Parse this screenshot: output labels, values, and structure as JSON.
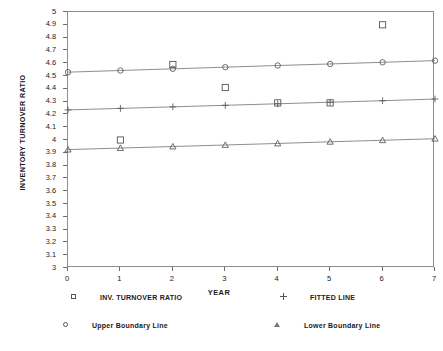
{
  "chart_data": {
    "type": "scatter",
    "title": "",
    "xlabel": "YEAR",
    "ylabel": "INVENTORY TURNOVER RATIO",
    "xlim": [
      0,
      7
    ],
    "ylim": [
      3,
      5
    ],
    "xticks": [
      0,
      1,
      2,
      3,
      4,
      5,
      6,
      7
    ],
    "yticks": [
      3,
      3.1,
      3.2,
      3.3,
      3.4,
      3.5,
      3.6,
      3.7,
      3.8,
      3.9,
      4,
      4.1,
      4.2,
      4.3,
      4.4,
      4.5,
      4.6,
      4.7,
      4.8,
      4.9,
      5
    ],
    "ytick_labels": [
      "3",
      "3.1",
      "3.2",
      "3.3",
      "3.4",
      "3.5",
      "3.6",
      "3.7",
      "3.8",
      "3.9",
      "4",
      "4.1",
      "4.2",
      "4.3",
      "4.4",
      "4.5",
      "4.6",
      "4.7",
      "4.8",
      "4.9",
      "5"
    ],
    "xtick_labels": [
      "0",
      "1",
      "2",
      "3",
      "4",
      "5",
      "6",
      "7"
    ],
    "grid": false,
    "legend_position": "below",
    "frame": true,
    "series": [
      {
        "name": "INV. TURNOVER RATIO",
        "marker": "square",
        "line": false,
        "x": [
          1,
          2,
          3,
          4,
          5,
          6
        ],
        "values": [
          4.0,
          4.59,
          4.41,
          4.29,
          4.29,
          4.9
        ]
      },
      {
        "name": "FITTED LINE",
        "marker": "plus",
        "line": true,
        "x": [
          0,
          1,
          2,
          3,
          4,
          5,
          6,
          7
        ],
        "values": [
          4.235,
          4.247,
          4.259,
          4.271,
          4.283,
          4.295,
          4.307,
          4.32
        ]
      },
      {
        "name": "Upper Boundary Line",
        "marker": "circle",
        "line": true,
        "x": [
          0,
          1,
          2,
          3,
          4,
          5,
          6,
          7
        ],
        "values": [
          4.53,
          4.543,
          4.556,
          4.569,
          4.582,
          4.594,
          4.607,
          4.62
        ]
      },
      {
        "name": "Lower Boundary Line",
        "marker": "triangle",
        "line": true,
        "x": [
          0,
          1,
          2,
          3,
          4,
          5,
          6,
          7
        ],
        "values": [
          3.925,
          3.937,
          3.949,
          3.961,
          3.973,
          3.986,
          3.998,
          4.01
        ]
      }
    ],
    "colors": {
      "line": "#7a7a7a",
      "marker_edge": "#555555",
      "axis": "#8d8d8d",
      "text": "#1a1a1a"
    }
  },
  "legend": {
    "items": [
      {
        "label": "INV. TURNOVER RATIO",
        "marker": "square"
      },
      {
        "label": "FITTED LINE",
        "marker": "plus"
      },
      {
        "label": "Upper Boundary Line",
        "marker": "circle"
      },
      {
        "label": "Lower Boundary Line",
        "marker": "triangle"
      }
    ]
  }
}
